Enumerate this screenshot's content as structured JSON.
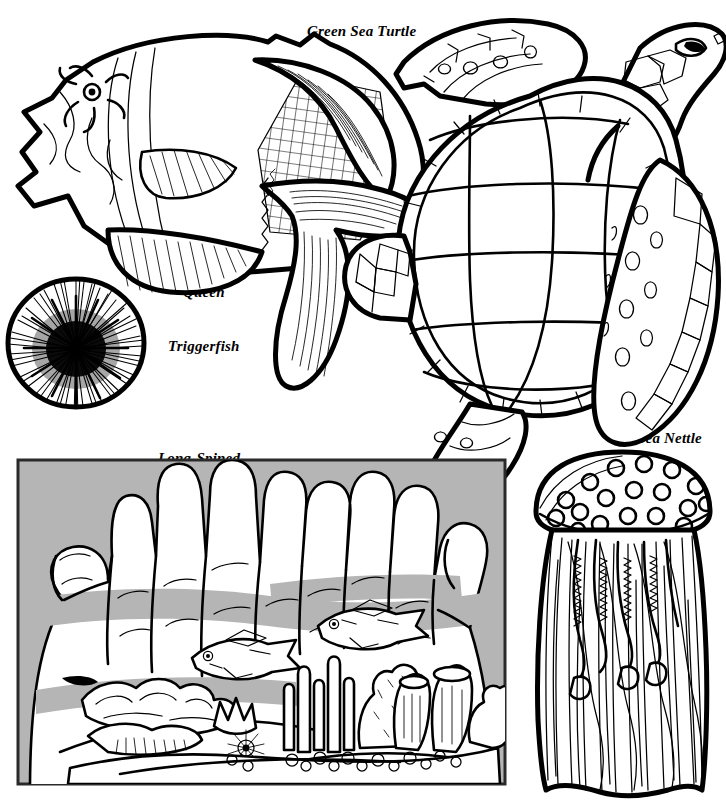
{
  "page": {
    "kind": "coloring-book-page",
    "background_color": "#ffffff",
    "ink_color": "#000000",
    "panel_gray": "#b5b5b5",
    "width": 726,
    "height": 806
  },
  "labels": {
    "turtle": "Green Sea Turtle",
    "triggerfish_line1": "Queen",
    "triggerfish_line2": "Triggerfish",
    "urchin_line1": "Long-Spined",
    "urchin_line2": "Black Urchin",
    "nettle": "Sea Nettle"
  },
  "illustrations": [
    {
      "name": "queen-triggerfish",
      "label": "Queen Triggerfish",
      "position": "top-left",
      "features": [
        "crosshatched body patch",
        "starburst eye ring",
        "lyre-shaped tail",
        "ray-lined dorsal and anal fins",
        "pectoral fin with fine rays"
      ]
    },
    {
      "name": "green-sea-turtle",
      "label": "Green Sea Turtle",
      "position": "top-right",
      "features": [
        "segmented carapace scutes",
        "scaly front flippers",
        "polygonal head plates",
        "almond eye with dark pupil",
        "rear flipper"
      ]
    },
    {
      "name": "long-spined-black-urchin",
      "label": "Long-Spined Black Urchin",
      "position": "left-middle",
      "features": [
        "round body outline",
        "dense radiating black spines",
        "dark solid center"
      ]
    },
    {
      "name": "hands-holding-reef",
      "label": "",
      "position": "bottom-left",
      "features": [
        "two cupped hands",
        "gray background panel",
        "two small reef fish",
        "branching coral",
        "tube sponges",
        "finger coral",
        "pebbled sandy floor",
        "small urchin"
      ]
    },
    {
      "name": "sea-nettle",
      "label": "Sea Nettle",
      "position": "bottom-right",
      "features": [
        "domed bell with open circle spots",
        "ruffled oral arms",
        "long trailing tentacles"
      ]
    }
  ]
}
